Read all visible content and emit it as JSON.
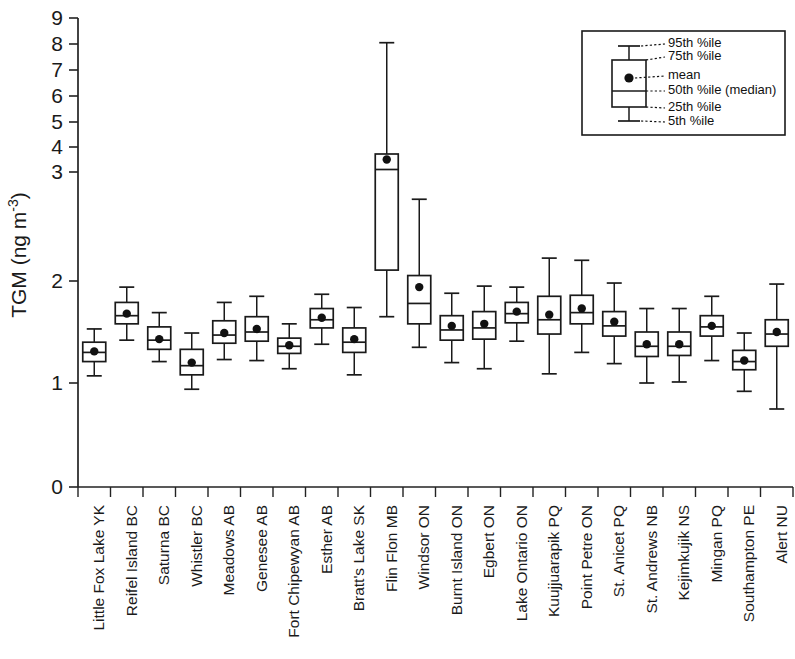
{
  "chart_data": {
    "type": "box",
    "title": "",
    "xlabel": "",
    "ylabel": "TGM (ng m-3)",
    "ylabel_base": "TGM (ng m",
    "ylabel_exp": "-3",
    "ylabel_close": ")",
    "ylim": [
      0,
      9
    ],
    "grid": false,
    "y_ticks": [
      0,
      1,
      2,
      3,
      4,
      5,
      6,
      7,
      8,
      9
    ],
    "y_tick_labels": [
      "0",
      "1",
      "2",
      "3",
      "4",
      "5",
      "6",
      "7",
      "8",
      "9"
    ],
    "y_tick_pixels": [
      487,
      383,
      281,
      172,
      147,
      122,
      96,
      70,
      44,
      18
    ],
    "axis_note": "piecewise compressed scale: 0-3 expanded, 3-9 compressed",
    "categories": [
      "Little Fox Lake YK",
      "Reifel Island BC",
      "Saturna BC",
      "Whistler BC",
      "Meadows AB",
      "Genesee AB",
      "Fort Chipewyan AB",
      "Esther AB",
      "Bratt's Lake SK",
      "Flin Flon MB",
      "Windsor ON",
      "Burnt Island ON",
      "Egbert ON",
      "Lake Ontario ON",
      "Kuujjuarapik PQ",
      "Point Petre ON",
      "St. Anicet PQ",
      "St. Andrews NB",
      "Kejimkujik NS",
      "Mingan PQ",
      "Southampton PE",
      "Alert NU"
    ],
    "series_name": "TGM distribution by station",
    "stats_keys": [
      "p5",
      "p25",
      "median",
      "mean",
      "p75",
      "p95"
    ],
    "boxes": [
      {
        "station": "Little Fox Lake YK",
        "p5": 1.07,
        "p25": 1.21,
        "median": 1.3,
        "mean": 1.31,
        "p75": 1.4,
        "p95": 1.53
      },
      {
        "station": "Reifel Island BC",
        "p5": 1.42,
        "p25": 1.58,
        "median": 1.66,
        "mean": 1.68,
        "p75": 1.79,
        "p95": 1.94
      },
      {
        "station": "Saturna BC",
        "p5": 1.21,
        "p25": 1.33,
        "median": 1.42,
        "mean": 1.43,
        "p75": 1.55,
        "p95": 1.69
      },
      {
        "station": "Whistler BC",
        "p5": 0.94,
        "p25": 1.08,
        "median": 1.17,
        "mean": 1.2,
        "p75": 1.33,
        "p95": 1.49
      },
      {
        "station": "Meadows AB",
        "p5": 1.23,
        "p25": 1.39,
        "median": 1.47,
        "mean": 1.49,
        "p75": 1.61,
        "p95": 1.79
      },
      {
        "station": "Genesee AB",
        "p5": 1.22,
        "p25": 1.41,
        "median": 1.5,
        "mean": 1.53,
        "p75": 1.65,
        "p95": 1.85
      },
      {
        "station": "Fort Chipewyan AB",
        "p5": 1.14,
        "p25": 1.29,
        "median": 1.36,
        "mean": 1.37,
        "p75": 1.44,
        "p95": 1.58
      },
      {
        "station": "Esther AB",
        "p5": 1.38,
        "p25": 1.54,
        "median": 1.62,
        "mean": 1.64,
        "p75": 1.73,
        "p95": 1.87
      },
      {
        "station": "Bratt's Lake SK",
        "p5": 1.08,
        "p25": 1.3,
        "median": 1.4,
        "mean": 1.43,
        "p75": 1.54,
        "p95": 1.74
      },
      {
        "station": "Flin Flon MB",
        "p5": 1.65,
        "p25": 2.1,
        "median": 3.1,
        "mean": 3.5,
        "p75": 3.72,
        "p95": 8.05
      },
      {
        "station": "Windsor ON",
        "p5": 1.35,
        "p25": 1.58,
        "median": 1.78,
        "mean": 1.94,
        "p75": 2.05,
        "p95": 2.75
      },
      {
        "station": "Burnt Island ON",
        "p5": 1.2,
        "p25": 1.42,
        "median": 1.52,
        "mean": 1.56,
        "p75": 1.66,
        "p95": 1.88
      },
      {
        "station": "Egbert ON",
        "p5": 1.14,
        "p25": 1.43,
        "median": 1.54,
        "mean": 1.58,
        "p75": 1.7,
        "p95": 1.95
      },
      {
        "station": "Lake Ontario ON",
        "p5": 1.41,
        "p25": 1.59,
        "median": 1.68,
        "mean": 1.7,
        "p75": 1.79,
        "p95": 1.94
      },
      {
        "station": "Kuujjuarapik PQ",
        "p5": 1.09,
        "p25": 1.48,
        "median": 1.62,
        "mean": 1.67,
        "p75": 1.85,
        "p95": 2.21
      },
      {
        "station": "Point Petre ON",
        "p5": 1.3,
        "p25": 1.58,
        "median": 1.69,
        "mean": 1.73,
        "p75": 1.86,
        "p95": 2.19
      },
      {
        "station": "St. Anicet PQ",
        "p5": 1.19,
        "p25": 1.46,
        "median": 1.56,
        "mean": 1.6,
        "p75": 1.7,
        "p95": 1.98
      },
      {
        "station": "St. Andrews NB",
        "p5": 1.0,
        "p25": 1.26,
        "median": 1.36,
        "mean": 1.38,
        "p75": 1.5,
        "p95": 1.73
      },
      {
        "station": "Kejimkujik NS",
        "p5": 1.01,
        "p25": 1.27,
        "median": 1.36,
        "mean": 1.38,
        "p75": 1.5,
        "p95": 1.73
      },
      {
        "station": "Mingan PQ",
        "p5": 1.22,
        "p25": 1.46,
        "median": 1.55,
        "mean": 1.56,
        "p75": 1.66,
        "p95": 1.85
      },
      {
        "station": "Southampton PE",
        "p5": 0.92,
        "p25": 1.13,
        "median": 1.21,
        "mean": 1.22,
        "p75": 1.32,
        "p95": 1.49
      },
      {
        "station": "Alert NU",
        "p5": 0.75,
        "p25": 1.36,
        "median": 1.48,
        "mean": 1.5,
        "p75": 1.62,
        "p95": 1.97
      }
    ]
  },
  "legend": {
    "position": "top-right",
    "items": [
      {
        "key": "p95",
        "label": "95th %ile"
      },
      {
        "key": "p75",
        "label": "75th %ile"
      },
      {
        "key": "mean",
        "label": "mean"
      },
      {
        "key": "median",
        "label": "50th %ile (median)"
      },
      {
        "key": "p25",
        "label": "25th %ile"
      },
      {
        "key": "p5",
        "label": "5th %ile"
      }
    ]
  },
  "colors": {
    "ink": "#1a1a1a",
    "background": "#ffffff",
    "mean_dot": "#111111"
  }
}
